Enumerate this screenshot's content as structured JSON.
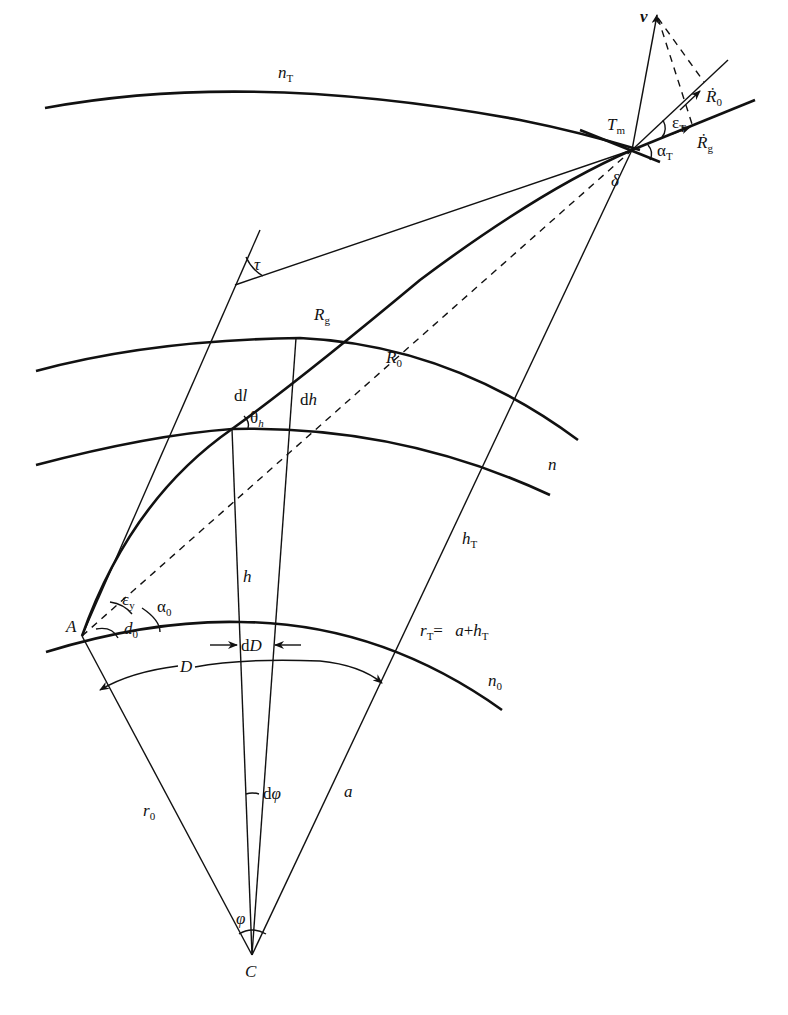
{
  "figure": {
    "labels": {
      "nT": {
        "main": "n",
        "sub": "T"
      },
      "v": {
        "main": "v"
      },
      "R0dot": {
        "main": "Ṙ",
        "sub": "0"
      },
      "Rgdot": {
        "main": "Ṙ",
        "sub": "g"
      },
      "Tm": {
        "main": "T",
        "sub": "m"
      },
      "epsT": {
        "main": "ε",
        "sub": "T"
      },
      "alphaT": {
        "main": "α",
        "sub": "T"
      },
      "delta": {
        "main": "δ"
      },
      "tau": {
        "main": "τ"
      },
      "Rg": {
        "main": "R",
        "sub": "g"
      },
      "R0": {
        "main": "R",
        "sub": "0"
      },
      "dl": {
        "prefix": "d",
        "main": "l"
      },
      "dh": {
        "prefix": "d",
        "main": "h"
      },
      "thetah": {
        "main": "θ",
        "sub": "h"
      },
      "n": {
        "main": "n"
      },
      "hT": {
        "main": "h",
        "sub": "T"
      },
      "h": {
        "main": "h"
      },
      "epsy": {
        "main": "ε",
        "sub": "y"
      },
      "alpha0": {
        "main": "α",
        "sub": "0"
      },
      "d0": {
        "main": "d",
        "sub": "0"
      },
      "A": {
        "main": "A"
      },
      "dD": {
        "prefix": "d",
        "main": "D"
      },
      "rT_eq": {
        "main": "r",
        "sub": "T",
        "eq": "= ",
        "rhs_a": "a",
        "plus": "+",
        "rhs_h": "h",
        "rhs_sub": "T"
      },
      "D": {
        "main": "D"
      },
      "n0": {
        "main": "n",
        "sub": "0"
      },
      "r0": {
        "main": "r",
        "sub": "0"
      },
      "dphi": {
        "prefix": "d",
        "main": "φ"
      },
      "a": {
        "main": "a"
      },
      "phi": {
        "main": "φ"
      },
      "C": {
        "main": "C"
      }
    }
  }
}
